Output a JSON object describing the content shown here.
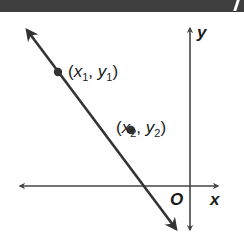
{
  "diagram": {
    "points": [
      {
        "name": "point-1",
        "var_x": "x",
        "sub_x": "1",
        "var_y": "y",
        "sub_y": "1",
        "cx": 58,
        "cy": 72
      },
      {
        "name": "point-2",
        "var_x": "x",
        "sub_x": "2",
        "var_y": "y",
        "sub_y": "2",
        "cx": 131,
        "cy": 130
      }
    ],
    "axes": {
      "x_label": "x",
      "y_label": "y",
      "origin_label": "O"
    },
    "line": {
      "x1": 25,
      "y1": 27,
      "x2": 178,
      "y2": 232
    },
    "colors": {
      "line": "#333333",
      "axis": "#444444",
      "topbar": "#3f3f3f",
      "text": "#1a1a1a"
    },
    "punct": {
      "open": "(",
      "comma": ", ",
      "close": ")"
    }
  }
}
